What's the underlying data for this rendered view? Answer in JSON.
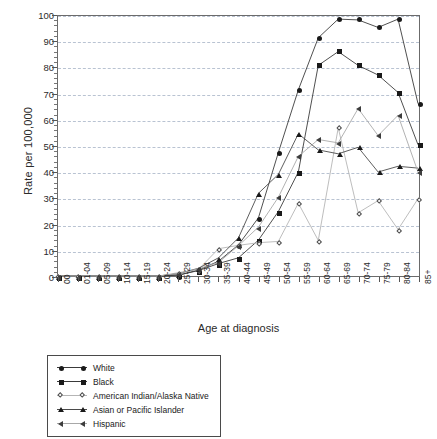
{
  "chart_data": {
    "type": "line",
    "title": "",
    "xlabel": "Age at diagnosis",
    "ylabel": "Rate per 100,000",
    "ylim": [
      0,
      100
    ],
    "ytick_step": 10,
    "yticks": [
      0,
      10,
      20,
      30,
      40,
      50,
      60,
      70,
      80,
      90,
      100
    ],
    "grid": "horizontal-dashed",
    "legend_position": "below-plot-left",
    "categories": [
      "00",
      "01-04",
      "05-09",
      "10-14",
      "15-19",
      "20-24",
      "25-29",
      "30-34",
      "35-39",
      "40-44",
      "45-49",
      "50-54",
      "55-59",
      "60-64",
      "65-69",
      "70-74",
      "75-79",
      "80-84",
      "85+"
    ],
    "series": [
      {
        "name": "White",
        "marker": "filled-circle",
        "values": [
          0,
          0,
          0,
          0,
          0,
          0,
          0.3,
          2.3,
          5.7,
          12.0,
          22.4,
          47.5,
          71.6,
          91.6,
          98.8,
          98.5,
          95.6,
          98.8,
          66.3
        ]
      },
      {
        "name": "Black",
        "marker": "filled-square",
        "values": [
          0,
          0,
          0,
          0,
          0,
          0,
          0.4,
          2.1,
          4.8,
          7.0,
          13.8,
          24.8,
          40.0,
          81.0,
          86.3,
          81.0,
          77.3,
          70.6,
          50.5
        ]
      },
      {
        "name": "American Indian/Alaska Native",
        "marker": "open-diamond",
        "values": [
          0,
          0,
          0,
          0,
          0,
          0,
          1.3,
          2.6,
          10.5,
          11.8,
          12.8,
          13.3,
          28.0,
          13.7,
          57.0,
          24.3,
          29.0,
          17.9,
          29.7
        ]
      },
      {
        "name": "Asian or Pacific Islander",
        "marker": "filled-triangle",
        "values": [
          0,
          0,
          0,
          0,
          0,
          0,
          0.9,
          3.0,
          7.0,
          14.7,
          31.8,
          39.1,
          54.7,
          48.5,
          47.0,
          49.5,
          40.0,
          42.2,
          41.5
        ]
      },
      {
        "name": "Hispanic",
        "marker": "left-triangle",
        "values": [
          0,
          0,
          0,
          0,
          0,
          0,
          1.0,
          2.8,
          5.2,
          11.7,
          18.8,
          30.3,
          46.0,
          52.5,
          51.2,
          64.4,
          54.0,
          61.8,
          40.0
        ]
      }
    ]
  },
  "axes": {
    "y_title": "Rate per 100,000",
    "x_title": "Age at diagnosis"
  },
  "legend": {
    "entries": [
      {
        "label": "White"
      },
      {
        "label": "Black"
      },
      {
        "label": "American Indian/Alaska Native"
      },
      {
        "label": "Asian or Pacific Islander"
      },
      {
        "label": "Hispanic"
      }
    ]
  }
}
